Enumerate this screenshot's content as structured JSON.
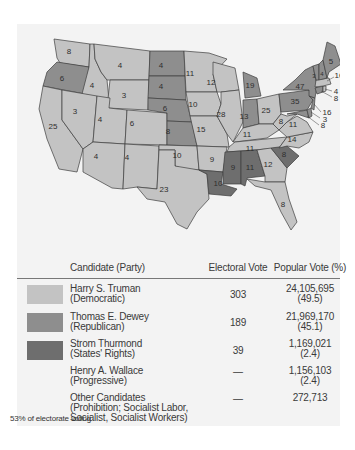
{
  "colors": {
    "democratic": "#c3c3c3",
    "republican": "#8e8e8e",
    "states_rights": "#6e6e6e",
    "panel": "#f3f3f3",
    "text": "#3a3a3a"
  },
  "map": {
    "title": "1948 Presidential Election",
    "states": [
      {
        "abbr": "WA",
        "ev": "8",
        "party": "democratic"
      },
      {
        "abbr": "OR",
        "ev": "6",
        "party": "republican"
      },
      {
        "abbr": "CA",
        "ev": "25",
        "party": "democratic"
      },
      {
        "abbr": "ID",
        "ev": "4",
        "party": "democratic"
      },
      {
        "abbr": "NV",
        "ev": "3",
        "party": "democratic"
      },
      {
        "abbr": "MT",
        "ev": "4",
        "party": "democratic"
      },
      {
        "abbr": "WY",
        "ev": "3",
        "party": "democratic"
      },
      {
        "abbr": "UT",
        "ev": "4",
        "party": "democratic"
      },
      {
        "abbr": "CO",
        "ev": "6",
        "party": "democratic"
      },
      {
        "abbr": "AZ",
        "ev": "4",
        "party": "democratic"
      },
      {
        "abbr": "NM",
        "ev": "4",
        "party": "democratic"
      },
      {
        "abbr": "ND",
        "ev": "4",
        "party": "republican"
      },
      {
        "abbr": "SD",
        "ev": "4",
        "party": "republican"
      },
      {
        "abbr": "NE",
        "ev": "6",
        "party": "republican"
      },
      {
        "abbr": "KS",
        "ev": "8",
        "party": "republican"
      },
      {
        "abbr": "OK",
        "ev": "10",
        "party": "democratic"
      },
      {
        "abbr": "TX",
        "ev": "23",
        "party": "democratic"
      },
      {
        "abbr": "MN",
        "ev": "11",
        "party": "democratic"
      },
      {
        "abbr": "IA",
        "ev": "10",
        "party": "democratic"
      },
      {
        "abbr": "MO",
        "ev": "15",
        "party": "democratic"
      },
      {
        "abbr": "AR",
        "ev": "9",
        "party": "democratic"
      },
      {
        "abbr": "LA",
        "ev": "10",
        "party": "states_rights"
      },
      {
        "abbr": "WI",
        "ev": "12",
        "party": "democratic"
      },
      {
        "abbr": "IL",
        "ev": "28",
        "party": "democratic"
      },
      {
        "abbr": "MI",
        "ev": "19",
        "party": "republican"
      },
      {
        "abbr": "IN",
        "ev": "13",
        "party": "republican"
      },
      {
        "abbr": "OH",
        "ev": "25",
        "party": "democratic"
      },
      {
        "abbr": "KY",
        "ev": "11",
        "party": "democratic"
      },
      {
        "abbr": "TN",
        "ev": "11",
        "party": "democratic"
      },
      {
        "abbr": "MS",
        "ev": "9",
        "party": "states_rights"
      },
      {
        "abbr": "AL",
        "ev": "11",
        "party": "states_rights"
      },
      {
        "abbr": "GA",
        "ev": "12",
        "party": "democratic"
      },
      {
        "abbr": "FL",
        "ev": "8",
        "party": "democratic"
      },
      {
        "abbr": "SC",
        "ev": "8",
        "party": "states_rights"
      },
      {
        "abbr": "NC",
        "ev": "14",
        "party": "democratic"
      },
      {
        "abbr": "VA",
        "ev": "11",
        "party": "democratic"
      },
      {
        "abbr": "WV",
        "ev": "8",
        "party": "democratic"
      },
      {
        "abbr": "PA",
        "ev": "35",
        "party": "republican"
      },
      {
        "abbr": "NY",
        "ev": "47",
        "party": "republican"
      },
      {
        "abbr": "VT",
        "ev": "3",
        "party": "republican"
      },
      {
        "abbr": "NH",
        "ev": "4",
        "party": "republican"
      },
      {
        "abbr": "ME",
        "ev": "5",
        "party": "republican"
      },
      {
        "abbr": "MA",
        "ev": "16",
        "party": "democratic"
      },
      {
        "abbr": "RI",
        "ev": "4",
        "party": "democratic"
      },
      {
        "abbr": "CT",
        "ev": "8",
        "party": "republican"
      },
      {
        "abbr": "NJ",
        "ev": "16",
        "party": "republican"
      },
      {
        "abbr": "DE",
        "ev": "3",
        "party": "republican"
      },
      {
        "abbr": "MD",
        "ev": "8",
        "party": "republican"
      }
    ]
  },
  "table": {
    "headers": {
      "candidate": "Candidate (Party)",
      "electoral": "Electoral Vote",
      "popular": "Popular Vote (%)"
    },
    "rows": [
      {
        "name": "Harry S. Truman",
        "party": "(Democratic)",
        "electoral": "303",
        "popular": "24,105,695",
        "percent": "(49.5)",
        "swatch": "democratic"
      },
      {
        "name": "Thomas E. Dewey",
        "party": "(Republican)",
        "electoral": "189",
        "popular": "21,969,170",
        "percent": "(45.1)",
        "swatch": "republican"
      },
      {
        "name": "Strom Thurmond",
        "party": "(States' Rights)",
        "electoral": "39",
        "popular": "1,169,021",
        "percent": "(2.4)",
        "swatch": "states_rights"
      },
      {
        "name": "Henry A. Wallace",
        "party": "(Progressive)",
        "electoral": "—",
        "popular": "1,156,103",
        "percent": "(2.4)",
        "swatch": null
      },
      {
        "name": "Other Candidates",
        "party": "(Prohibition; Socialist Labor,",
        "party2": "Socialist, Socialist Workers)",
        "electoral": "—",
        "popular": "272,713",
        "percent": "",
        "swatch": null
      }
    ]
  },
  "footnote": "53% of electorate voting"
}
